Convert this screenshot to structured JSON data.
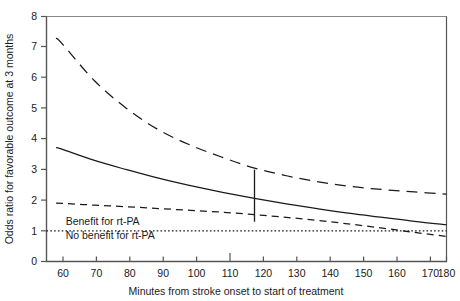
{
  "chart_data": {
    "type": "line",
    "title": "",
    "xlabel": "Minutes from stroke onset to start of treatment",
    "ylabel": "Odds ratio for favorable outcome at 3 months",
    "xlim": [
      55,
      180
    ],
    "ylim": [
      0,
      8
    ],
    "xticks": [
      60,
      70,
      80,
      90,
      100,
      110,
      120,
      130,
      140,
      150,
      160,
      170,
      180
    ],
    "yticks": [
      0,
      1,
      2,
      3,
      4,
      5,
      6,
      7,
      8
    ],
    "grid": false,
    "legend_position": "none",
    "x": [
      58,
      60,
      70,
      80,
      90,
      100,
      110,
      120,
      130,
      140,
      150,
      160,
      170,
      180
    ],
    "series": [
      {
        "name": "Upper 95% confidence limit",
        "style": "dashed-long",
        "values": [
          7.3,
          7.1,
          5.9,
          5.0,
          4.3,
          3.8,
          3.4,
          3.05,
          2.8,
          2.6,
          2.45,
          2.35,
          2.27,
          2.2
        ]
      },
      {
        "name": "Adjusted odds ratio",
        "style": "solid",
        "values": [
          3.72,
          3.66,
          3.3,
          3.0,
          2.72,
          2.48,
          2.26,
          2.06,
          1.88,
          1.72,
          1.57,
          1.44,
          1.31,
          1.2
        ]
      },
      {
        "name": "Lower 95% confidence limit",
        "style": "dashed-short",
        "values": [
          1.91,
          1.9,
          1.84,
          1.79,
          1.73,
          1.67,
          1.61,
          1.53,
          1.44,
          1.34,
          1.22,
          1.09,
          0.95,
          0.82
        ]
      }
    ],
    "reference_line": {
      "name": "No benefit reference line",
      "style": "dotted",
      "y": 1.0
    },
    "error_bar": {
      "name": "confidence interval marker",
      "x": 120,
      "low": 1.3,
      "high": 3.0
    },
    "annotations": [
      {
        "name": "benefit-label",
        "text": "Benefit for rt-PA",
        "x": 61,
        "y": 1.18
      },
      {
        "name": "no-benefit-label",
        "text": "No benefit for rt-PA",
        "x": 61,
        "y": 0.72
      }
    ]
  },
  "axis": {
    "x_title": "Minutes from stroke onset to start of treatment",
    "y_title": "Odds ratio for favorable outcome at 3 months",
    "x_tick_labels": [
      "60",
      "70",
      "80",
      "90",
      "100",
      "110",
      "120",
      "130",
      "140",
      "150",
      "160",
      "170",
      "180"
    ],
    "y_tick_labels": [
      "0",
      "1",
      "2",
      "3",
      "4",
      "5",
      "6",
      "7",
      "8"
    ]
  },
  "annotations": {
    "benefit": "Benefit for rt-PA",
    "no_benefit": "No benefit for rt-PA"
  },
  "colors": {
    "line": "#1a1a1a",
    "axis": "#555555",
    "background": "#ffffff"
  }
}
